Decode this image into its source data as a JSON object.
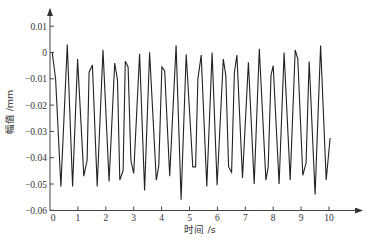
{
  "chart_data": {
    "type": "line",
    "title": "",
    "xlabel": "时间 /s",
    "ylabel": "幅值 /mm",
    "xlim": [
      0,
      10
    ],
    "ylim": [
      -0.06,
      0.01
    ],
    "grid": false,
    "legend": null,
    "x_ticks": [
      0,
      1,
      2,
      3,
      4,
      5,
      6,
      7,
      8,
      9,
      10
    ],
    "x_tick_labels": [
      "0",
      "1",
      "2",
      "3",
      "4",
      "5",
      "6",
      "7",
      "8",
      "9",
      "10"
    ],
    "y_ticks": [
      0.01,
      0,
      -0.01,
      -0.02,
      -0.03,
      -0.04,
      -0.05,
      -0.06
    ],
    "y_tick_labels": [
      "0.01",
      "0",
      "−0.01",
      "−0.02",
      "−0.03",
      "−0.04",
      "−0.05",
      "−0.06"
    ],
    "series": [
      {
        "name": "amplitude",
        "color": "#222222",
        "x": [
          0.08,
          0.2,
          0.39,
          0.62,
          0.81,
          0.99,
          1.21,
          1.33,
          1.4,
          1.52,
          1.69,
          1.9,
          2.12,
          2.32,
          2.42,
          2.5,
          2.62,
          2.7,
          2.8,
          2.9,
          3.0,
          3.21,
          3.39,
          3.57,
          3.81,
          3.9,
          4.01,
          4.11,
          4.29,
          4.52,
          4.7,
          4.88,
          5.12,
          5.22,
          5.3,
          5.42,
          5.62,
          5.81,
          5.99,
          6.21,
          6.3,
          6.4,
          6.51,
          6.61,
          6.7,
          6.9,
          7.11,
          7.32,
          7.5,
          7.74,
          7.82,
          7.92,
          8.0,
          8.21,
          8.39,
          8.61,
          8.79,
          8.88,
          9.06,
          9.18,
          9.26,
          9.29,
          9.5,
          9.7,
          9.9,
          10.04
        ],
        "y": [
          0.0,
          -0.01,
          -0.051,
          0.003,
          -0.051,
          -0.0025,
          -0.047,
          -0.041,
          -0.0075,
          -0.0047,
          -0.051,
          0.001,
          -0.049,
          -0.004,
          -0.0105,
          -0.0485,
          -0.045,
          -0.0033,
          -0.0055,
          -0.041,
          -0.046,
          -0.0005,
          -0.0525,
          0.0001,
          -0.0485,
          -0.043,
          -0.0055,
          -0.007,
          -0.047,
          0.0027,
          -0.056,
          -0.0007,
          -0.0435,
          -0.0435,
          -0.01,
          -0.001,
          -0.051,
          0.0,
          -0.0505,
          -0.0025,
          -0.0087,
          -0.0435,
          -0.0455,
          -0.0075,
          -0.001,
          -0.0477,
          -0.0037,
          -0.05,
          0.0014,
          -0.0485,
          -0.0435,
          -0.0087,
          -0.005,
          -0.05,
          0.0,
          -0.0485,
          0.001,
          -0.0025,
          -0.0467,
          -0.042,
          -0.0125,
          -0.0034,
          -0.054,
          0.0027,
          -0.0485,
          -0.0325
        ]
      }
    ]
  },
  "axes": {
    "x_title": "时间 /s",
    "y_title": "幅值 /mm"
  }
}
